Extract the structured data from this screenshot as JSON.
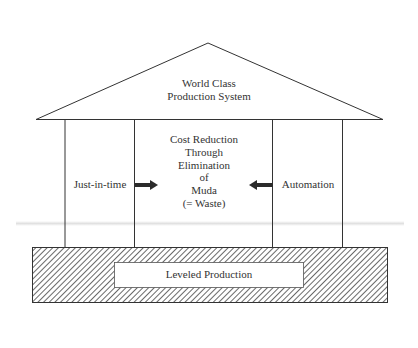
{
  "diagram": {
    "type": "house-of-lean",
    "roof": {
      "lines": [
        "World Class",
        "Production System"
      ]
    },
    "pillars": [
      {
        "label": "Just-in-time"
      },
      {
        "label": "Automation"
      }
    ],
    "center": {
      "lines": [
        "Cost Reduction",
        "Through",
        "Elimination",
        "of",
        "Muda",
        "(= Waste)"
      ]
    },
    "arrows": [
      {
        "from": "Just-in-time",
        "to": "center",
        "direction": "right"
      },
      {
        "from": "Automation",
        "to": "center",
        "direction": "left"
      }
    ],
    "foundation": {
      "label": "Leveled Production",
      "fill": "diagonal-hatch"
    },
    "colors": {
      "stroke": "#333333",
      "text": "#333333",
      "background": "#ffffff",
      "arrow": "#2b2b2b"
    }
  }
}
